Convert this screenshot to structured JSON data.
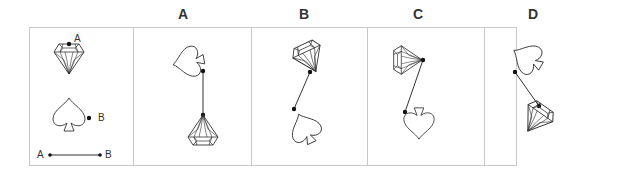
{
  "question": {
    "reference_labels": {
      "point_a": "A",
      "point_b": "B",
      "segment_start": "A",
      "segment_end": "B"
    }
  },
  "options": [
    {
      "label": "A",
      "description": "Spade on top (tilted), diamond hanging below; line from spade to diamond top"
    },
    {
      "label": "B",
      "description": "Diamond on top (tilted), spade below; line connecting"
    },
    {
      "label": "C",
      "description": "Diamond rotated on its side, spade upside down below; line connecting"
    },
    {
      "label": "D",
      "description": "Spade tilted on top, diamond tilted below; line connecting"
    }
  ],
  "colors": {
    "stroke": "#333333",
    "border": "#c8c8c8",
    "dot": "#111111"
  }
}
